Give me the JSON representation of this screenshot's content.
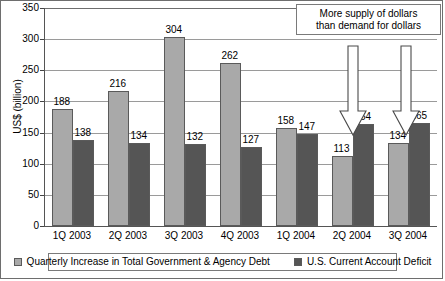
{
  "chart_data": {
    "type": "bar",
    "title": "",
    "xlabel": "",
    "ylabel": "US$ (billion)",
    "ylim": [
      0,
      350
    ],
    "yticks": [
      0,
      50,
      100,
      150,
      200,
      250,
      300,
      350
    ],
    "grid": true,
    "legend_position": "bottom",
    "categories": [
      "1Q 2003",
      "2Q 2003",
      "3Q 2003",
      "4Q 2003",
      "1Q 2004",
      "2Q 2004",
      "3Q 2004"
    ],
    "series": [
      {
        "name": "Quarterly Increase in Total Government & Agency Debt",
        "color": "#a9a9a9",
        "values": [
          188,
          216,
          304,
          262,
          158,
          113,
          134
        ]
      },
      {
        "name": "U.S. Current Account Deficit",
        "color": "#555555",
        "values": [
          138,
          134,
          132,
          127,
          147,
          164,
          165
        ]
      }
    ],
    "annotations": [
      {
        "name": "supply-demand-note",
        "line1": "More supply of dollars",
        "line2": "than demand for dollars"
      }
    ],
    "arrows": [
      {
        "name": "arrow-2q-2004",
        "points_to": "2Q 2004"
      },
      {
        "name": "arrow-3q-2004",
        "points_to": "3Q 2004"
      }
    ]
  }
}
